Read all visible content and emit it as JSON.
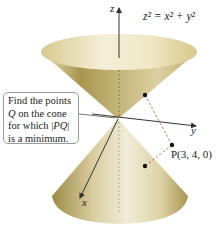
{
  "figure": {
    "equation": "z² = x² + y²",
    "axes": {
      "z": "z",
      "y": "y",
      "x": "x"
    },
    "point_label": "P(3, 4, 0)",
    "callout": {
      "line1": "Find the points",
      "line2_var": "Q",
      "line2_rest": " on the cone",
      "line3_pre": "for which |",
      "line3_var": "PQ",
      "line3_post": "|",
      "line4": "is a minimum."
    },
    "colors": {
      "cone_light": "#f3efd9",
      "cone_mid": "#d9cc9a",
      "cone_dark": "#8c7a3e",
      "axis": "#333333",
      "dashed": "#c0504d"
    }
  }
}
